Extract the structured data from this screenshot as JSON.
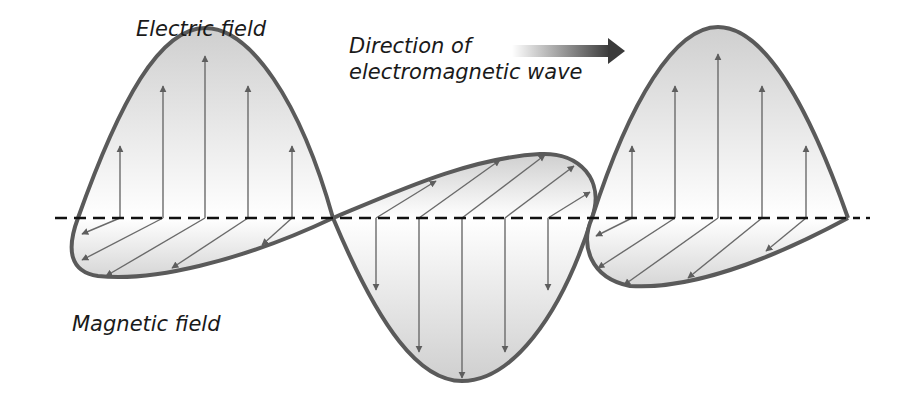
{
  "labels": {
    "electric_field": "Electric field",
    "direction_line1": "Direction of",
    "direction_line2": "electromagnetic wave",
    "magnetic_field": "Magnetic field"
  },
  "colors": {
    "curve": "#5a5a5a",
    "arrow": "#666666",
    "axis": "#111111",
    "fill_dark": "#d4d4d4",
    "fill_light": "#ffffff",
    "direction_arrow": "#3c3c3c"
  },
  "diagram": {
    "type": "electromagnetic-wave",
    "axis_y": 218,
    "electric_field_lobes": [
      "up",
      "down",
      "up"
    ],
    "magnetic_field_lobes": [
      "front-down",
      "back-up",
      "front-down"
    ],
    "direction": "right"
  }
}
